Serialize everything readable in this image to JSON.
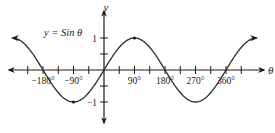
{
  "chart_data": {
    "type": "line",
    "title": "",
    "annotation": "y = Sin θ",
    "xlabel": "θ",
    "ylabel": "y",
    "function": "sin",
    "x_unit": "degrees",
    "xlim": [
      -270,
      450
    ],
    "ylim": [
      -1,
      1
    ],
    "x_tick_step": 45,
    "y_tick_step": 0.5,
    "x_tick_labels": [
      "−180°",
      "−90°",
      "90°",
      "180°",
      "270°",
      "360°"
    ],
    "x_tick_label_values": [
      -180,
      -90,
      90,
      180,
      270,
      360
    ],
    "y_tick_labels": [
      "1",
      "−1"
    ],
    "y_tick_label_values": [
      1,
      -1
    ],
    "series": [
      {
        "name": "y = Sin θ",
        "x": [
          -270,
          -225,
          -180,
          -135,
          -90,
          -45,
          0,
          45,
          90,
          135,
          180,
          225,
          270,
          315,
          360,
          405,
          450
        ],
        "y": [
          1,
          0.707,
          0,
          -0.707,
          -1,
          -0.707,
          0,
          0.707,
          1,
          0.707,
          0,
          -0.707,
          -1,
          -0.707,
          0,
          0.707,
          1
        ]
      }
    ],
    "marked_points": [
      {
        "x": -90,
        "y": -1
      },
      {
        "x": 90,
        "y": 1
      }
    ],
    "grid": false,
    "legend": "none",
    "colors": {
      "axis": "#1a1a1a",
      "curve": "#2a2a2a"
    }
  }
}
